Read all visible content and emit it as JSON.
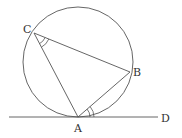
{
  "diagram": {
    "type": "geometry",
    "colors": {
      "stroke": "#444444",
      "label": "#333333",
      "background": "#ffffff"
    },
    "circle": {
      "cx": 78,
      "cy": 62,
      "r": 55
    },
    "points": {
      "A": {
        "label": "A",
        "x": 78,
        "y": 117
      },
      "B": {
        "label": "B",
        "x": 130,
        "y": 72
      },
      "C": {
        "label": "C",
        "x": 34,
        "y": 33
      },
      "D": {
        "label": "D",
        "x": 158,
        "y": 117
      }
    },
    "segments": [
      "CA",
      "CB",
      "AB",
      "tangent AD"
    ],
    "angle_marks": [
      {
        "vertex": "C",
        "between": [
          "A",
          "B"
        ],
        "arcs": 2
      },
      {
        "vertex": "A",
        "between": [
          "B",
          "D"
        ],
        "arcs": 2
      }
    ]
  }
}
